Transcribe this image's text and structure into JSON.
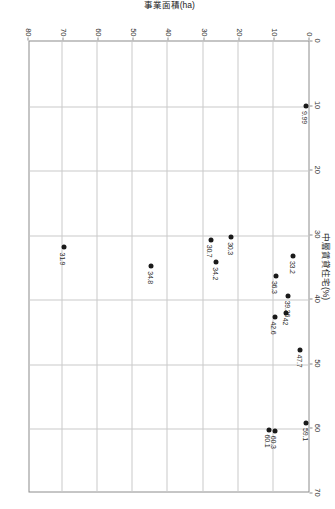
{
  "chart_data": {
    "type": "scatter",
    "title": "",
    "xlabel": "中層賃貸住宅(%)",
    "ylabel": "事業面積(ha)",
    "xlim": [
      0,
      70
    ],
    "ylim": [
      0,
      80
    ],
    "xticks": [
      "0",
      "10",
      "20",
      "30",
      "40",
      "50",
      "60",
      "70"
    ],
    "yticks": [
      "0",
      "10",
      "20",
      "30",
      "40",
      "50",
      "60",
      "70",
      "80"
    ],
    "grid": true,
    "legend": "none",
    "points": [
      {
        "x": 9.99,
        "y": 0.8,
        "label": "9.99"
      },
      {
        "x": 59.1,
        "y": 0.6,
        "label": "59.1"
      },
      {
        "x": 47.7,
        "y": 2.3,
        "label": "47.7"
      },
      {
        "x": 33.2,
        "y": 4.4,
        "label": "33.2"
      },
      {
        "x": 39.36,
        "y": 5.7,
        "label": "39.36"
      },
      {
        "x": 42.0,
        "y": 6.3,
        "label": "42"
      },
      {
        "x": 36.3,
        "y": 9.3,
        "label": "36.3"
      },
      {
        "x": 42.6,
        "y": 9.6,
        "label": "42.6"
      },
      {
        "x": 60.3,
        "y": 9.6,
        "label": "60.3"
      },
      {
        "x": 60.1,
        "y": 11.3,
        "label": "60.1"
      },
      {
        "x": 30.3,
        "y": 22.0,
        "label": "30.3"
      },
      {
        "x": 34.2,
        "y": 26.2,
        "label": "34.2"
      },
      {
        "x": 30.7,
        "y": 27.8,
        "label": "30.7"
      },
      {
        "x": 34.8,
        "y": 44.8,
        "label": "34.8"
      },
      {
        "x": 31.9,
        "y": 69.7,
        "label": "31.9"
      }
    ]
  }
}
